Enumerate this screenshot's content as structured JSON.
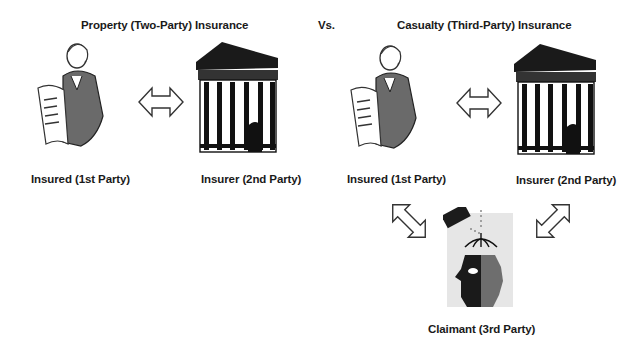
{
  "diagram": {
    "left_panel": {
      "title": "Property (Two-Party) Insurance",
      "parties": [
        {
          "label": "Insured (1st Party)",
          "icon": "businesswoman-icon"
        },
        {
          "label": "Insurer (2nd Party)",
          "icon": "bank-building-icon"
        }
      ],
      "connector": "double-arrow-horizontal-icon"
    },
    "separator": "Vs.",
    "right_panel": {
      "title": "Casualty (Third-Party) Insurance",
      "parties": [
        {
          "label": "Insured (1st Party)",
          "icon": "businesswoman-icon"
        },
        {
          "label": "Insurer (2nd Party)",
          "icon": "bank-building-icon"
        },
        {
          "label": "Claimant (3rd Party)",
          "icon": "injured-person-head-icon"
        }
      ],
      "connectors": [
        "double-arrow-horizontal-icon",
        "double-arrow-diagonal-icon",
        "double-arrow-diagonal-icon"
      ]
    }
  }
}
